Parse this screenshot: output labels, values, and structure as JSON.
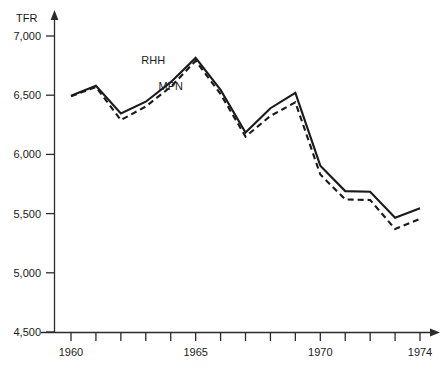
{
  "chart_data": {
    "type": "line",
    "title": "",
    "subtitle": "",
    "xlabel": "",
    "ylabel": "TFR",
    "ylabel_position": "top-left",
    "grid": false,
    "legend_position": "inline-annotation",
    "xlim": [
      1959,
      1974.6
    ],
    "ylim": [
      4500,
      7100
    ],
    "y_ticks": [
      4500,
      5000,
      5500,
      6000,
      6500,
      7000
    ],
    "y_tick_labels": [
      "4,500",
      "5,000",
      "5,500",
      "6,000",
      "6,500",
      "7,000"
    ],
    "x_ticks": [
      1960,
      1961,
      1962,
      1963,
      1964,
      1965,
      1966,
      1967,
      1968,
      1969,
      1970,
      1971,
      1972,
      1973,
      1974
    ],
    "x_tick_labels_shown": [
      "1960",
      "1965",
      "1970",
      "1974"
    ],
    "x_labeled_years": [
      1960,
      1965,
      1970,
      1974
    ],
    "x": [
      1960,
      1961,
      1962,
      1963,
      1964,
      1965,
      1966,
      1967,
      1968,
      1969,
      1970,
      1971,
      1972,
      1973,
      1974
    ],
    "series": [
      {
        "name": "RHH",
        "style": "solid",
        "label_x": 1963.3,
        "label_y": 6760,
        "values": [
          6495,
          6580,
          6345,
          6445,
          6610,
          6815,
          6545,
          6185,
          6390,
          6520,
          5905,
          5690,
          5685,
          5465,
          5545
        ]
      },
      {
        "name": "MPN",
        "style": "dashed",
        "label_x": 1964.0,
        "label_y": 6540,
        "values": [
          6490,
          6570,
          6290,
          6405,
          6570,
          6790,
          6510,
          6150,
          6325,
          6440,
          5830,
          5620,
          5615,
          5370,
          5455
        ]
      }
    ]
  },
  "axis": {
    "y_axis_title": "TFR",
    "arrow_y": true,
    "arrow_x": true
  }
}
